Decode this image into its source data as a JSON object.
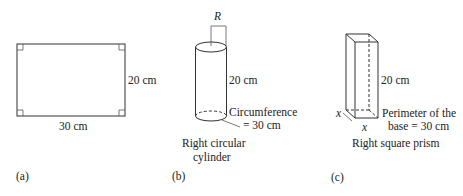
{
  "panels": [
    {
      "id": "a",
      "tag": "(a)",
      "shape": "rectangle",
      "width_label": "30 cm",
      "height_label": "20 cm"
    },
    {
      "id": "b",
      "tag": "(b)",
      "shape": "right circular cylinder",
      "radius_label": "R",
      "height_label": "20 cm",
      "circumference_label_line1": "Circumference",
      "circumference_label_line2": "= 30 cm",
      "caption_line1": "Right circular",
      "caption_line2": "cylinder"
    },
    {
      "id": "c",
      "tag": "(c)",
      "shape": "right square prism",
      "height_label": "20 cm",
      "side_label_left": "x",
      "side_label_bottom": "x",
      "perimeter_label_line1": "Perimeter of the",
      "perimeter_label_line2": "base = 30 cm",
      "caption": "Right square prism"
    }
  ],
  "colors": {
    "stroke": "#333333",
    "text": "#222222",
    "background": "#ffffff"
  }
}
